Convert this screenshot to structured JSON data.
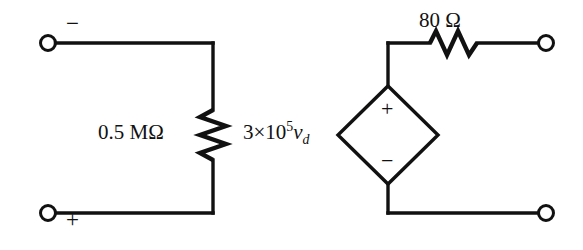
{
  "figure": {
    "background_color": "#ffffff",
    "stroke_color": "#111111"
  },
  "components": {
    "input_resistor": {
      "name": "input-resistance",
      "label": "0.5 MΩ",
      "value": "0.5",
      "unit": "MΩ",
      "orientation": "vertical"
    },
    "output_resistor": {
      "name": "output-resistance",
      "label": "80 Ω",
      "value": "80",
      "unit": "Ω",
      "orientation": "horizontal"
    },
    "dependent_source": {
      "name": "dependent-voltage-source",
      "label_prefix": "3",
      "label_times": "×",
      "label_base": "10",
      "label_exponent": "5",
      "label_variable": "v",
      "label_subscript": "d",
      "label_full": "3×10⁵vₔ",
      "shape": "diamond",
      "polarity_top": "+",
      "polarity_bottom": "−"
    }
  },
  "terminals": {
    "top_left": {
      "name": "terminal-top-left",
      "polarity": "−"
    },
    "bottom_left": {
      "name": "terminal-bottom-left",
      "polarity": "+"
    },
    "top_right": {
      "name": "terminal-top-right",
      "polarity": ""
    },
    "bottom_right": {
      "name": "terminal-bottom-right",
      "polarity": ""
    }
  }
}
